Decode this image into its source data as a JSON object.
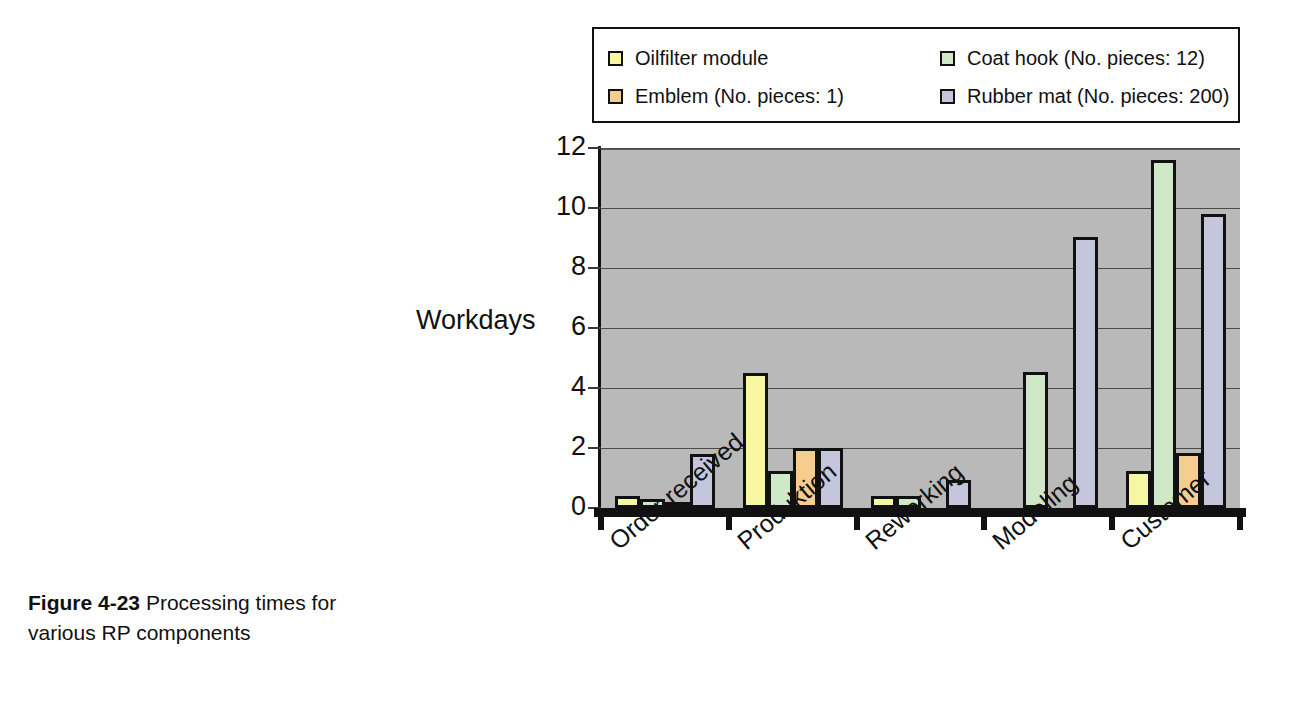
{
  "caption": {
    "figure_number": "Figure 4-23",
    "text": "Processing times for various RP components"
  },
  "legend": {
    "entries": [
      {
        "label": "Oilfilter module",
        "color": "#f6f6a3"
      },
      {
        "label": "Coat hook (No. pieces: 12)",
        "color": "#cfe8c8"
      },
      {
        "label": "Emblem (No. pieces: 1)",
        "color": "#f7cc8f"
      },
      {
        "label": "Rubber mat (No. pieces: 200)",
        "color": "#c5c5dc"
      }
    ]
  },
  "chart_data": {
    "type": "bar",
    "title": "",
    "xlabel": "",
    "ylabel": "Workdays",
    "ylim": [
      0,
      12
    ],
    "yticks": [
      0,
      2,
      4,
      6,
      8,
      10,
      12
    ],
    "ytick_labels": [
      "0",
      "2",
      "4",
      "6",
      "8",
      "10",
      "12"
    ],
    "grid": true,
    "legend_position": "top",
    "plot_background": "#b9b9b9",
    "categories": [
      "Order received",
      "Produktion",
      "Reworking",
      "Modeling",
      "Customer"
    ],
    "series": [
      {
        "name": "Oilfilter module",
        "color": "#f6f6a3",
        "values": [
          0.4,
          4.5,
          0.4,
          0,
          1.25
        ]
      },
      {
        "name": "Coat hook (No. pieces: 12)",
        "color": "#cfe8c8",
        "values": [
          0.3,
          1.25,
          0.4,
          4.55,
          11.6
        ]
      },
      {
        "name": "Emblem (No. pieces: 1)",
        "color": "#f7cc8f",
        "values": [
          0.05,
          2.0,
          0,
          0,
          1.85
        ]
      },
      {
        "name": "Rubber mat (No. pieces: 200)",
        "color": "#c5c5dc",
        "values": [
          1.8,
          2.0,
          0.95,
          9.05,
          9.8
        ]
      }
    ]
  }
}
